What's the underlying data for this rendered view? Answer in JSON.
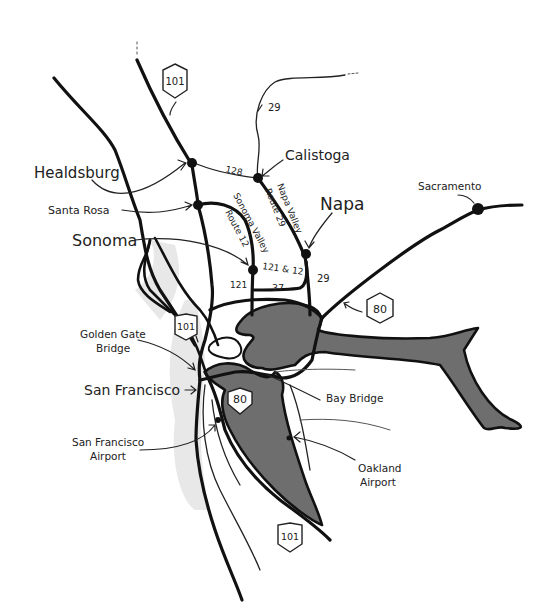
{
  "map": {
    "title": "San Francisco Bay Area & Wine Country",
    "background_color": "#ffffff",
    "water_color": "#6e6e6e",
    "cities": [
      {
        "name": "Healdsburg",
        "size": "medium"
      },
      {
        "name": "Santa Rosa",
        "size": "small"
      },
      {
        "name": "Sonoma",
        "size": "large"
      },
      {
        "name": "Calistoga",
        "size": "medium"
      },
      {
        "name": "Napa",
        "size": "large"
      },
      {
        "name": "Sacramento",
        "size": "small"
      },
      {
        "name": "San Francisco",
        "size": "medium"
      }
    ],
    "landmarks": {
      "golden_gate_line1": "Golden Gate",
      "golden_gate_line2": "Bridge",
      "bay_bridge": "Bay Bridge",
      "sfo_line1": "San Francisco",
      "sfo_line2": "Airport",
      "oak_line1": "Oakland",
      "oak_line2": "Airport"
    },
    "shields": {
      "us101_north": "101",
      "us101_gg": "101",
      "us101_south": "101",
      "i80_east": "80",
      "i80_bay": "80"
    },
    "route_labels": {
      "r29_north": "29",
      "r128": "128",
      "napa_valley_1": "Napa Valley",
      "napa_valley_2": "Route 29",
      "sonoma_valley_1": "Sonoma Valley",
      "sonoma_valley_2": "Route 12",
      "r121_12": "121 & 12",
      "r121": "121",
      "r37": "37",
      "r29_south": "29"
    }
  }
}
